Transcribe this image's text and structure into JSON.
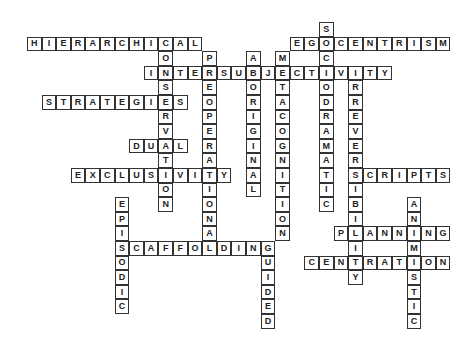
{
  "puzzle": {
    "type": "crossword",
    "grid": {
      "origin_x": 27,
      "origin_y": 22,
      "cell_size": 14.6,
      "border_color": "#333333",
      "text_color": "#222222"
    },
    "words": [
      {
        "answer": "HIERARCHICAL",
        "direction": "across",
        "row": 1,
        "col": 0
      },
      {
        "answer": "EGOCENTRISM",
        "direction": "across",
        "row": 1,
        "col": 18
      },
      {
        "answer": "INTERSUBJECTIVITY",
        "direction": "across",
        "row": 3,
        "col": 8
      },
      {
        "answer": "STRATEGIES",
        "direction": "across",
        "row": 5,
        "col": 1
      },
      {
        "answer": "DUAL",
        "direction": "across",
        "row": 8,
        "col": 7
      },
      {
        "answer": "EXCLUSIVITY",
        "direction": "across",
        "row": 10,
        "col": 3
      },
      {
        "answer": "SCRIPTS",
        "direction": "across",
        "row": 10,
        "col": 22
      },
      {
        "answer": "PLANNING",
        "direction": "across",
        "row": 14,
        "col": 21
      },
      {
        "answer": "SCAFFOLDING",
        "direction": "across",
        "row": 15,
        "col": 6
      },
      {
        "answer": "CENTRATION",
        "direction": "across",
        "row": 16,
        "col": 19
      },
      {
        "answer": "SOCIODRAMATIC",
        "direction": "down",
        "row": 0,
        "col": 20
      },
      {
        "answer": "CONSERVATION",
        "direction": "down",
        "row": 1,
        "col": 9
      },
      {
        "answer": "PREOPERATIONAL",
        "direction": "down",
        "row": 2,
        "col": 12
      },
      {
        "answer": "ABORIGINAL",
        "direction": "down",
        "row": 2,
        "col": 15
      },
      {
        "answer": "METACOGNITION",
        "direction": "down",
        "row": 2,
        "col": 17
      },
      {
        "answer": "IRREVERSIBILITY",
        "direction": "down",
        "row": 3,
        "col": 22
      },
      {
        "answer": "EPISODIC",
        "direction": "down",
        "row": 12,
        "col": 6
      },
      {
        "answer": "ANIMISTIC",
        "direction": "down",
        "row": 12,
        "col": 26
      },
      {
        "answer": "GUIDED",
        "direction": "down",
        "row": 15,
        "col": 16
      }
    ]
  }
}
